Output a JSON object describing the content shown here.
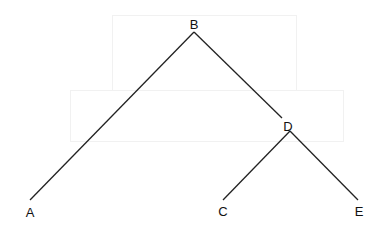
{
  "diagram": {
    "type": "tree",
    "root": "B",
    "nodes": [
      {
        "id": "B",
        "label": "B",
        "x": 194,
        "y": 24
      },
      {
        "id": "A",
        "label": "A",
        "x": 30,
        "y": 212
      },
      {
        "id": "D",
        "label": "D",
        "x": 288,
        "y": 126
      },
      {
        "id": "C",
        "label": "C",
        "x": 223,
        "y": 211
      },
      {
        "id": "E",
        "label": "E",
        "x": 359,
        "y": 211
      }
    ],
    "edges": [
      {
        "from": "B",
        "to": "A"
      },
      {
        "from": "B",
        "to": "D"
      },
      {
        "from": "D",
        "to": "C"
      },
      {
        "from": "D",
        "to": "E"
      }
    ],
    "line_color": "#222222"
  }
}
